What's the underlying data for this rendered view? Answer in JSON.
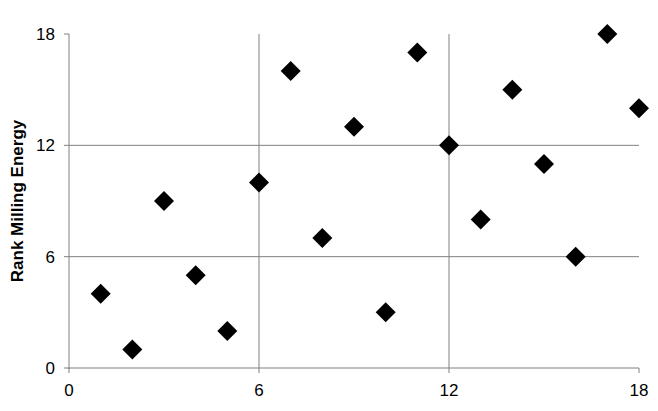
{
  "partial_header": "",
  "chart_data": {
    "type": "scatter",
    "title": "",
    "xlabel": "",
    "ylabel": "Rank Milling Energy",
    "xlim": [
      0,
      18
    ],
    "ylim": [
      0,
      18
    ],
    "x_ticks": [
      0,
      6,
      12,
      18
    ],
    "y_ticks": [
      0,
      6,
      12,
      18
    ],
    "grid": true,
    "legend": null,
    "marker": "diamond",
    "marker_color": "#000000",
    "gridline_color": "#808080",
    "series": [
      {
        "name": "Rank",
        "points": [
          {
            "x": 1,
            "y": 4
          },
          {
            "x": 2,
            "y": 1
          },
          {
            "x": 3,
            "y": 9
          },
          {
            "x": 4,
            "y": 5
          },
          {
            "x": 5,
            "y": 2
          },
          {
            "x": 6,
            "y": 10
          },
          {
            "x": 7,
            "y": 16
          },
          {
            "x": 8,
            "y": 7
          },
          {
            "x": 9,
            "y": 13
          },
          {
            "x": 10,
            "y": 3
          },
          {
            "x": 11,
            "y": 17
          },
          {
            "x": 12,
            "y": 12
          },
          {
            "x": 13,
            "y": 8
          },
          {
            "x": 14,
            "y": 15
          },
          {
            "x": 15,
            "y": 11
          },
          {
            "x": 16,
            "y": 6
          },
          {
            "x": 17,
            "y": 18
          },
          {
            "x": 18,
            "y": 14
          }
        ]
      }
    ]
  }
}
